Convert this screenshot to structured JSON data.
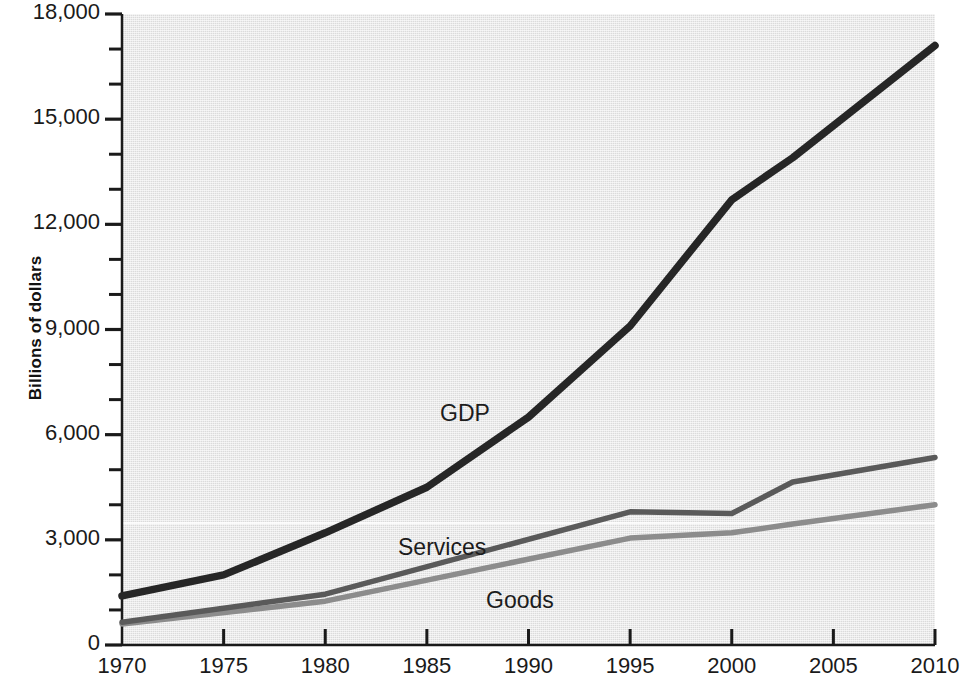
{
  "chart_data": {
    "type": "line",
    "title": "",
    "xlabel": "",
    "ylabel": "Billions of dollars",
    "x": [
      1970,
      1975,
      1980,
      1985,
      1990,
      1995,
      2000,
      2005,
      2010
    ],
    "xlim": [
      1970,
      2010
    ],
    "ylim": [
      0,
      18000
    ],
    "y_tick_step_major": 3000,
    "y_tick_step_minor": 1000,
    "grid": false,
    "legend_position": "inline-annotations",
    "x_tick_labels": [
      "1970",
      "1975",
      "1980",
      "1985",
      "1990",
      "1995",
      "2000",
      "2005",
      "2010"
    ],
    "y_tick_labels": [
      "0",
      "3,000",
      "6,000",
      "9,000",
      "12,000",
      "15,000",
      "18,000"
    ],
    "series": [
      {
        "name": "GDP",
        "color": "#262626",
        "values": [
          1400,
          2000,
          3200,
          4500,
          6500,
          9100,
          12700,
          14500,
          17100
        ],
        "vertices": [
          {
            "year": 1970,
            "value": 1400
          },
          {
            "year": 1975,
            "value": 2000
          },
          {
            "year": 1980,
            "value": 3200
          },
          {
            "year": 1985,
            "value": 4500
          },
          {
            "year": 1990,
            "value": 6500
          },
          {
            "year": 1995,
            "value": 9100
          },
          {
            "year": 2000,
            "value": 12700
          },
          {
            "year": 2003,
            "value": 13900
          },
          {
            "year": 2010,
            "value": 17100
          }
        ]
      },
      {
        "name": "Services",
        "color": "#5a5a5a",
        "values": [
          650,
          1000,
          1450,
          2050,
          2900,
          3800,
          3750,
          4650,
          5350
        ],
        "vertices": [
          {
            "year": 1970,
            "value": 650
          },
          {
            "year": 1980,
            "value": 1450
          },
          {
            "year": 1995,
            "value": 3800
          },
          {
            "year": 2000,
            "value": 3750
          },
          {
            "year": 2003,
            "value": 4650
          },
          {
            "year": 2010,
            "value": 5350
          }
        ]
      },
      {
        "name": "Goods",
        "color": "#8c8c8c",
        "values": [
          600,
          900,
          1250,
          1800,
          2400,
          3050,
          3200,
          3600,
          4000
        ],
        "vertices": [
          {
            "year": 1970,
            "value": 600
          },
          {
            "year": 1980,
            "value": 1250
          },
          {
            "year": 1995,
            "value": 3050
          },
          {
            "year": 2000,
            "value": 3200
          },
          {
            "year": 2003,
            "value": 3450
          },
          {
            "year": 2010,
            "value": 4000
          }
        ]
      }
    ],
    "annotations": [
      {
        "text": "GDP",
        "x_px": 440,
        "y_px": 402
      },
      {
        "text": "Services",
        "x_px": 398,
        "y_px": 536
      },
      {
        "text": "Goods",
        "x_px": 486,
        "y_px": 589
      }
    ]
  },
  "colors": {
    "gdp": "#262626",
    "services": "#5a5a5a",
    "goods": "#8c8c8c",
    "plot_background": "#e2e2e2",
    "axis": "#1a1a1a",
    "page_background": "#ffffff"
  }
}
